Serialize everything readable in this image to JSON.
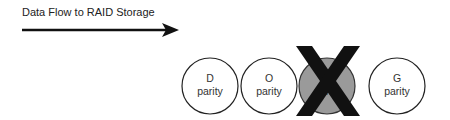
{
  "diagram": {
    "flow_label": "Data Flow to RAID Storage",
    "disks": [
      {
        "letter": "D",
        "sub": "parity",
        "failed": false,
        "cx": 210
      },
      {
        "letter": "O",
        "sub": "parity",
        "failed": false,
        "cx": 269
      },
      {
        "letter": "P",
        "sub": "parity",
        "failed": true,
        "cx": 327
      },
      {
        "letter": "G",
        "sub": "parity",
        "failed": false,
        "cx": 397
      }
    ],
    "colors": {
      "disk_stroke": "#222222",
      "failed_fill": "#9a9a9a",
      "cross": "#111111"
    }
  }
}
